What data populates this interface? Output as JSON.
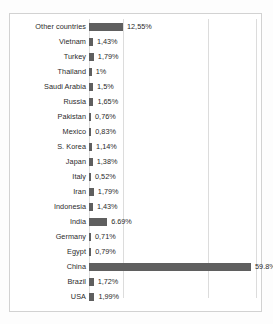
{
  "chart_data": {
    "type": "bar",
    "orientation": "horizontal",
    "title": "",
    "subtitle": "",
    "xlabel": "",
    "ylabel": "",
    "grid": true,
    "legend": "none",
    "xlim": [
      0,
      65
    ],
    "gridline_values": [
      12.55,
      44.9,
      63.0
    ],
    "bar_color": "#5f5f5f",
    "frame_color": "#d2d2d2",
    "gridline_color": "#dcdcdc",
    "categories": [
      "Other countries",
      "Vietnam",
      "Turkey",
      "Thailand",
      "Saudi Arabia",
      "Russia",
      "Pakistan",
      "Mexico",
      "S. Korea",
      "Japan",
      "Italy",
      "Iran",
      "Indonesia",
      "India",
      "Germany",
      "Egypt",
      "China",
      "Brazil",
      "USA"
    ],
    "values": [
      12.55,
      1.43,
      1.79,
      1,
      1.5,
      1.65,
      0.76,
      0.83,
      1.14,
      1.38,
      0.52,
      1.79,
      1.43,
      6.69,
      0.71,
      0.79,
      59.8,
      1.72,
      1.99
    ],
    "data_labels": [
      "12,55%",
      "1,43%",
      "1,79%",
      "1%",
      "1,5%",
      "1,65%",
      "0,76%",
      "0,83%",
      "1,14%",
      "1,38%",
      "0,52%",
      "1,79%",
      "1,43%",
      "6.69%",
      "0,71%",
      "0,79%",
      "59.8%",
      "1,72%",
      "1,99%"
    ]
  }
}
